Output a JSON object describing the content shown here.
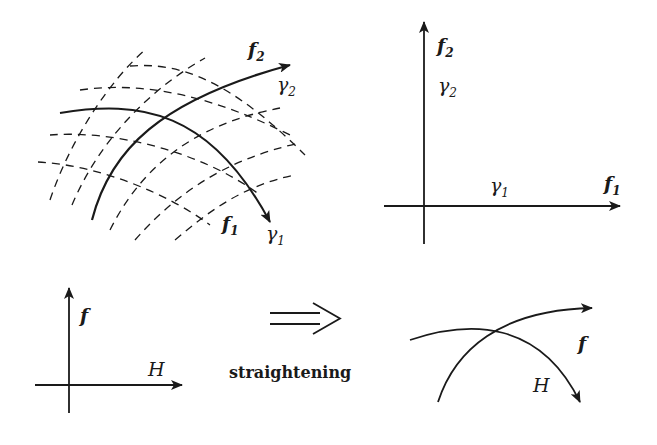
{
  "diagram": {
    "top_left": {
      "labels": {
        "f2": "f",
        "f2_sub": "2",
        "gamma2": "γ",
        "gamma2_sub": "2",
        "f1": "f",
        "f1_sub": "1",
        "gamma1": "γ",
        "gamma1_sub": "1"
      }
    },
    "top_right": {
      "labels": {
        "f2": "f",
        "f2_sub": "2",
        "gamma2": "γ",
        "gamma2_sub": "2",
        "gamma1": "γ",
        "gamma1_sub": "1",
        "f1": "f",
        "f1_sub": "1"
      }
    },
    "bottom_left": {
      "labels": {
        "f": "f",
        "H": "H"
      }
    },
    "middle": {
      "arrow": "⟹",
      "caption": "straightening"
    },
    "bottom_right": {
      "labels": {
        "f": "f",
        "H": "H"
      }
    },
    "colors": {
      "ink": "#1a1a1a",
      "background": "#ffffff"
    }
  }
}
